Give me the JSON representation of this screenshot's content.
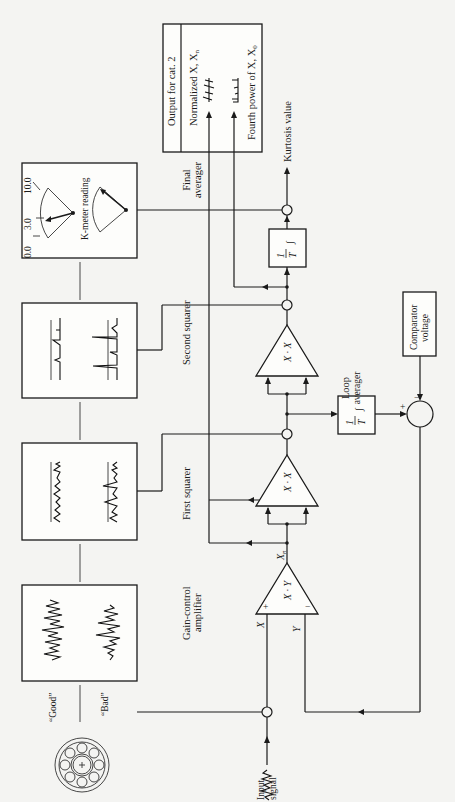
{
  "diagram": {
    "orientation": "rotated 90 degrees counterclockwise",
    "blocks": {
      "output_box": {
        "title": "Output for cat. 2",
        "row1": "Normalized X, X",
        "row1_sub": "n",
        "row2": "Fourth power of X, X",
        "row2_sup": "4",
        "row2_sub": "0"
      },
      "kmeter": {
        "label": "K-meter reading",
        "scale_min": "0.0",
        "scale_mid": "3.0",
        "scale_max": "10.0"
      },
      "second_squarer_display": {},
      "first_squarer_display": {},
      "gain_display": {
        "good_label": "“Good”",
        "bad_label": "“Bad”"
      }
    },
    "labels": {
      "final_averager_1": "Final",
      "final_averager_2": "averager",
      "second_squarer": "Second squarer",
      "first_squarer": "First squarer",
      "gain_control_1": "Gain-control",
      "gain_control_2": "amplifier",
      "loop_averager_1": "Loop",
      "loop_averager_2": "averager",
      "kurtosis_value": "Kurtosis value",
      "comparator_1": "Comparator",
      "comparator_2": "voltage",
      "input_1": "Input",
      "input_2": "signal"
    },
    "operators": {
      "integrator": "1/T ∫",
      "integrator_num": "1",
      "integrator_den": "T",
      "integrator_sym": "∫",
      "square_1": "X · X",
      "square_2": "X · X",
      "gain": "X · Y",
      "plus": "+",
      "minus": "−"
    },
    "signals": {
      "x": "X",
      "xn": "X",
      "xn_sub": "n",
      "y": "Y"
    }
  }
}
